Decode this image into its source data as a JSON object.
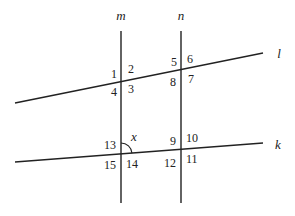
{
  "diagram": {
    "colors": {
      "ink": "#222222",
      "background": "#ffffff"
    },
    "lines": {
      "m": {
        "label": "m",
        "x1": 121,
        "y1": 31,
        "x2": 121,
        "y2": 203,
        "label_x": 121,
        "label_y": 20
      },
      "n": {
        "label": "n",
        "x1": 181,
        "y1": 31,
        "x2": 181,
        "y2": 203,
        "label_x": 181,
        "label_y": 20
      },
      "l": {
        "label": "l",
        "x1": 15,
        "y1": 103,
        "x2": 263,
        "y2": 53,
        "label_x": 279,
        "label_y": 58
      },
      "k": {
        "label": "k",
        "x1": 15,
        "y1": 162,
        "x2": 263,
        "y2": 143,
        "label_x": 278,
        "label_y": 149
      }
    },
    "angle_labels": [
      {
        "id": "1",
        "text": "1",
        "x": 111,
        "y": 78
      },
      {
        "id": "2",
        "text": "2",
        "x": 128,
        "y": 73
      },
      {
        "id": "3",
        "text": "3",
        "x": 128,
        "y": 93
      },
      {
        "id": "4",
        "text": "4",
        "x": 111,
        "y": 96
      },
      {
        "id": "5",
        "text": "5",
        "x": 171,
        "y": 66
      },
      {
        "id": "6",
        "text": "6",
        "x": 187,
        "y": 63
      },
      {
        "id": "7",
        "text": "7",
        "x": 188,
        "y": 83
      },
      {
        "id": "8",
        "text": "8",
        "x": 170,
        "y": 86
      },
      {
        "id": "9",
        "text": "9",
        "x": 170,
        "y": 145
      },
      {
        "id": "10",
        "text": "10",
        "x": 186,
        "y": 142
      },
      {
        "id": "11",
        "text": "11",
        "x": 186,
        "y": 163
      },
      {
        "id": "12",
        "text": "12",
        "x": 164,
        "y": 167
      },
      {
        "id": "13",
        "text": "13",
        "x": 104,
        "y": 149
      },
      {
        "id": "14",
        "text": "14",
        "x": 126,
        "y": 168
      },
      {
        "id": "15",
        "text": "15",
        "x": 104,
        "y": 169
      }
    ],
    "angle_x": {
      "label": "x",
      "label_x": 131,
      "label_y": 141,
      "center_x": 121,
      "center_y": 154,
      "radius": 11
    }
  }
}
